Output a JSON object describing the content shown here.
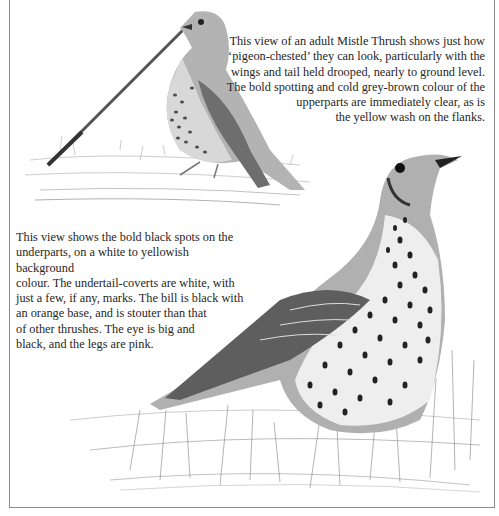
{
  "page": {
    "subject": "Mistle Thrush",
    "top_cut_text": "………………………………"
  },
  "captions": {
    "top": {
      "lines": [
        "This view of an adult Mistle Thrush shows just how",
        "‘pigeon-chested’ they can look, particularly with the",
        "wings and tail held drooped, nearly to ground level.",
        "The bold spotting and cold grey-brown colour of the",
        "upperparts are immediately clear, as is",
        "the yellow wash on the flanks."
      ]
    },
    "bottom": {
      "lines": [
        "This view shows the bold black spots on the",
        "underparts, on a white to yellowish background",
        "colour. The undertail-coverts are white, with",
        "just a few, if any, marks. The bill is black with",
        "an orange base, and is stouter than that",
        "of other thrushes. The eye is big and",
        "black, and the legs are pink."
      ]
    }
  },
  "illustrations": [
    {
      "name": "adult-mistle-thrush-pigeon-chested",
      "description": "Standing thrush beside a long stalk, wings and tail drooped"
    },
    {
      "name": "mistle-thrush-spotted-underparts",
      "description": "Close view of thrush in grass showing bold black spots"
    }
  ],
  "colors": {
    "ink": "#262626",
    "frame": "#8c8c8c",
    "pencil": "#6b6b6b"
  }
}
